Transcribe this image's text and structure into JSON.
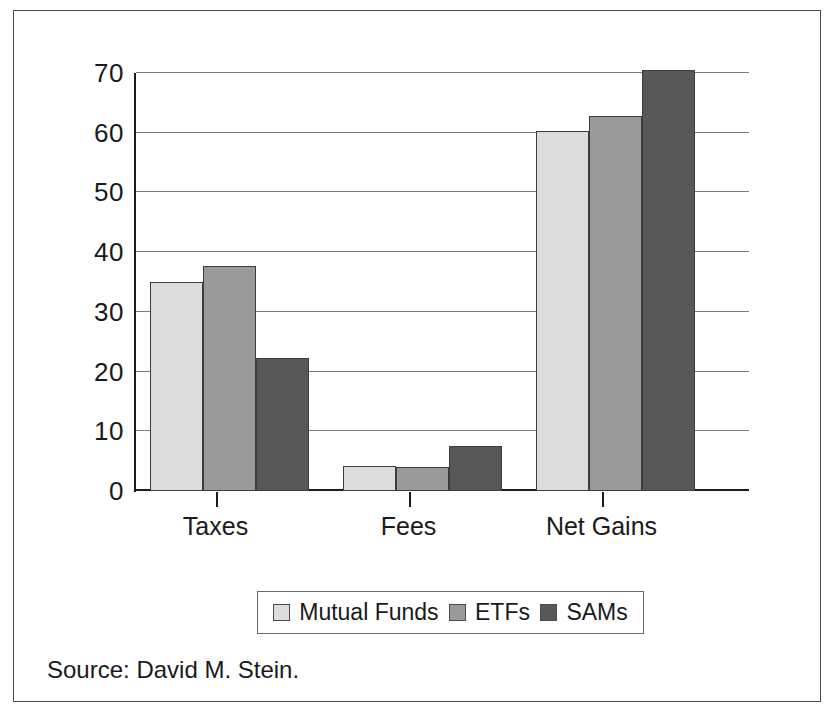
{
  "chart_data": {
    "type": "bar",
    "title": "",
    "subtitle": "",
    "xlabel": "",
    "ylabel": "",
    "ylim": [
      0,
      70
    ],
    "yticks": [
      0,
      10,
      20,
      30,
      40,
      50,
      60,
      70
    ],
    "ytick_labels": [
      "0",
      "10",
      "20",
      "30",
      "40",
      "50",
      "60",
      "70"
    ],
    "grid": true,
    "legend_position": "bottom",
    "categories": [
      "Taxes",
      "Fees",
      "Net Gains"
    ],
    "series": [
      {
        "name": "Mutual Funds",
        "color": "#dcdcdc",
        "values": [
          35.0,
          4.2,
          60.3
        ]
      },
      {
        "name": "ETFs",
        "color": "#9a9a9a",
        "values": [
          37.7,
          4.1,
          62.8
        ]
      },
      {
        "name": "SAMs",
        "color": "#585858",
        "values": [
          22.3,
          7.6,
          70.5
        ]
      }
    ]
  },
  "source": {
    "text": "Source: David M. Stein."
  }
}
